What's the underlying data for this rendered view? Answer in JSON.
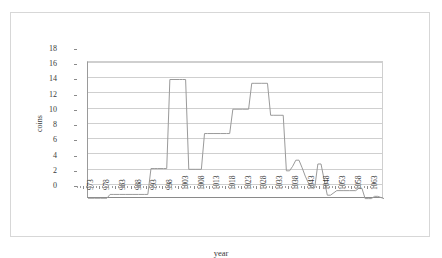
{
  "chart_data": {
    "type": "line",
    "title": "",
    "xlabel": "year",
    "ylabel": "coins",
    "xlim": [
      971,
      1065
    ],
    "ylim": [
      0,
      18
    ],
    "ytick_step": 2,
    "yticks": [
      0,
      2,
      4,
      6,
      8,
      10,
      12,
      14,
      16,
      18
    ],
    "xticks": [
      973,
      978,
      983,
      988,
      993,
      998,
      1003,
      1008,
      1013,
      1018,
      1023,
      1028,
      1033,
      1038,
      1043,
      1048,
      1053,
      1058,
      1063
    ],
    "grid": "horizontal",
    "legend": "none",
    "line_color": "#9a9a9a",
    "series": [
      {
        "name": "coins",
        "x": [
          971,
          973,
          975,
          977,
          978,
          979,
          981,
          983,
          985,
          987,
          989,
          990,
          991,
          992,
          993,
          995,
          996,
          997,
          998,
          1000,
          1001,
          1002,
          1003,
          1005,
          1007,
          1008,
          1009,
          1011,
          1013,
          1015,
          1016,
          1017,
          1018,
          1020,
          1022,
          1023,
          1024,
          1026,
          1028,
          1029,
          1030,
          1032,
          1033,
          1034,
          1035,
          1036,
          1037,
          1038,
          1039,
          1040,
          1041,
          1042,
          1043,
          1044,
          1045,
          1046,
          1047,
          1048,
          1050,
          1052,
          1054,
          1056,
          1057,
          1058,
          1059,
          1060,
          1061,
          1062,
          1063,
          1065
        ],
        "y": [
          0.1,
          0.1,
          0.1,
          0.1,
          0.6,
          0.6,
          0.6,
          0.6,
          0.6,
          0.6,
          0.6,
          0.6,
          4.0,
          4.0,
          4.0,
          4.0,
          4.0,
          15.7,
          15.7,
          15.7,
          15.7,
          15.7,
          3.9,
          3.9,
          3.9,
          8.6,
          8.6,
          8.6,
          8.6,
          8.6,
          8.6,
          11.8,
          11.8,
          11.8,
          11.8,
          15.2,
          15.2,
          15.2,
          15.2,
          11.0,
          11.0,
          11.0,
          11.0,
          3.7,
          3.7,
          4.3,
          5.1,
          5.1,
          4.1,
          3.0,
          2.1,
          1.5,
          1.5,
          4.6,
          4.6,
          2.5,
          0.5,
          0.5,
          1.1,
          1.1,
          1.1,
          1.1,
          1.4,
          1.4,
          0.05,
          0.05,
          0.05,
          0.35,
          0.35,
          0.05
        ]
      }
    ]
  },
  "axes": {
    "x_title": "year",
    "y_title": "coins"
  }
}
